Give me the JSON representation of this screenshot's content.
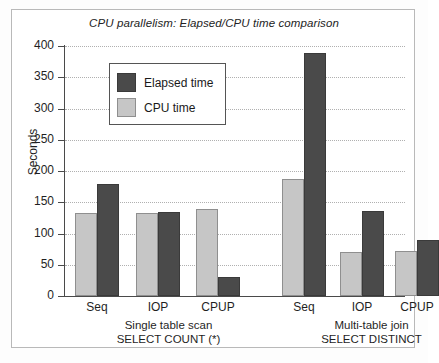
{
  "chart_data": {
    "type": "bar",
    "title": "CPU parallelism:  Elapsed/CPU time comparison",
    "xlabel": "",
    "ylabel": "Seconds",
    "ylim": [
      0,
      400
    ],
    "ytick_labels": [
      "400",
      "350",
      "300",
      "250",
      "200",
      "150",
      "100",
      "50",
      "0"
    ],
    "ytick_values": [
      400,
      350,
      300,
      250,
      200,
      150,
      100,
      50,
      0
    ],
    "grid": true,
    "legend_position": "upper-left-inside",
    "categories": [
      "Seq",
      "IOP",
      "CPUP",
      "Seq",
      "IOP",
      "CPUP"
    ],
    "groups": [
      {
        "name": "Single table scan",
        "subtitle": "SELECT COUNT (*)",
        "categories": [
          "Seq",
          "IOP",
          "CPUP"
        ]
      },
      {
        "name": "Multi-table join",
        "subtitle": "SELECT DISTINCT",
        "categories": [
          "Seq",
          "IOP",
          "CPUP"
        ]
      }
    ],
    "series": [
      {
        "name": "CPU time",
        "color": "#c6c6c6",
        "values": [
          133,
          133,
          139,
          188,
          70,
          72
        ]
      },
      {
        "name": "Elapsed time",
        "color": "#4a4a4a",
        "values": [
          180,
          134,
          30,
          389,
          136,
          90
        ]
      }
    ],
    "bars": [
      {
        "group": 0,
        "category": "Seq",
        "series": "CPU time",
        "value": 133
      },
      {
        "group": 0,
        "category": "Seq",
        "series": "Elapsed time",
        "value": 180
      },
      {
        "group": 0,
        "category": "IOP",
        "series": "CPU time",
        "value": 133
      },
      {
        "group": 0,
        "category": "IOP",
        "series": "Elapsed time",
        "value": 134
      },
      {
        "group": 0,
        "category": "CPUP",
        "series": "CPU time",
        "value": 139
      },
      {
        "group": 0,
        "category": "CPUP",
        "series": "Elapsed time",
        "value": 30
      },
      {
        "group": 1,
        "category": "Seq",
        "series": "CPU time",
        "value": 188
      },
      {
        "group": 1,
        "category": "Seq",
        "series": "Elapsed time",
        "value": 389
      },
      {
        "group": 1,
        "category": "IOP",
        "series": "CPU time",
        "value": 70
      },
      {
        "group": 1,
        "category": "IOP",
        "series": "Elapsed time",
        "value": 136
      },
      {
        "group": 1,
        "category": "CPUP",
        "series": "CPU time",
        "value": 72
      },
      {
        "group": 1,
        "category": "CPUP",
        "series": "Elapsed time",
        "value": 90
      }
    ]
  },
  "legend": {
    "entries": [
      {
        "label": "Elapsed time",
        "color": "#4a4a4a"
      },
      {
        "label": "CPU time",
        "color": "#c6c6c6"
      }
    ]
  },
  "axes": {
    "y_title": "Seconds",
    "y_labels": [
      "400",
      "350",
      "300",
      "250",
      "200",
      "150",
      "100",
      "50",
      "0"
    ],
    "x_labels": [
      "Seq",
      "IOP",
      "CPUP",
      "Seq",
      "IOP",
      "CPUP"
    ]
  },
  "group_captions": [
    {
      "line1": "Single table scan",
      "line2": "SELECT COUNT (*)"
    },
    {
      "line1": "Multi-table join",
      "line2": "SELECT DISTINCT"
    }
  ],
  "title": "CPU parallelism:  Elapsed/CPU time comparison",
  "colors": {
    "elapsed": "#4a4a4a",
    "cpu": "#c6c6c6",
    "axis": "#4a4a4a",
    "grid": "#b0b0b0",
    "frame": "#b9b9b9"
  }
}
